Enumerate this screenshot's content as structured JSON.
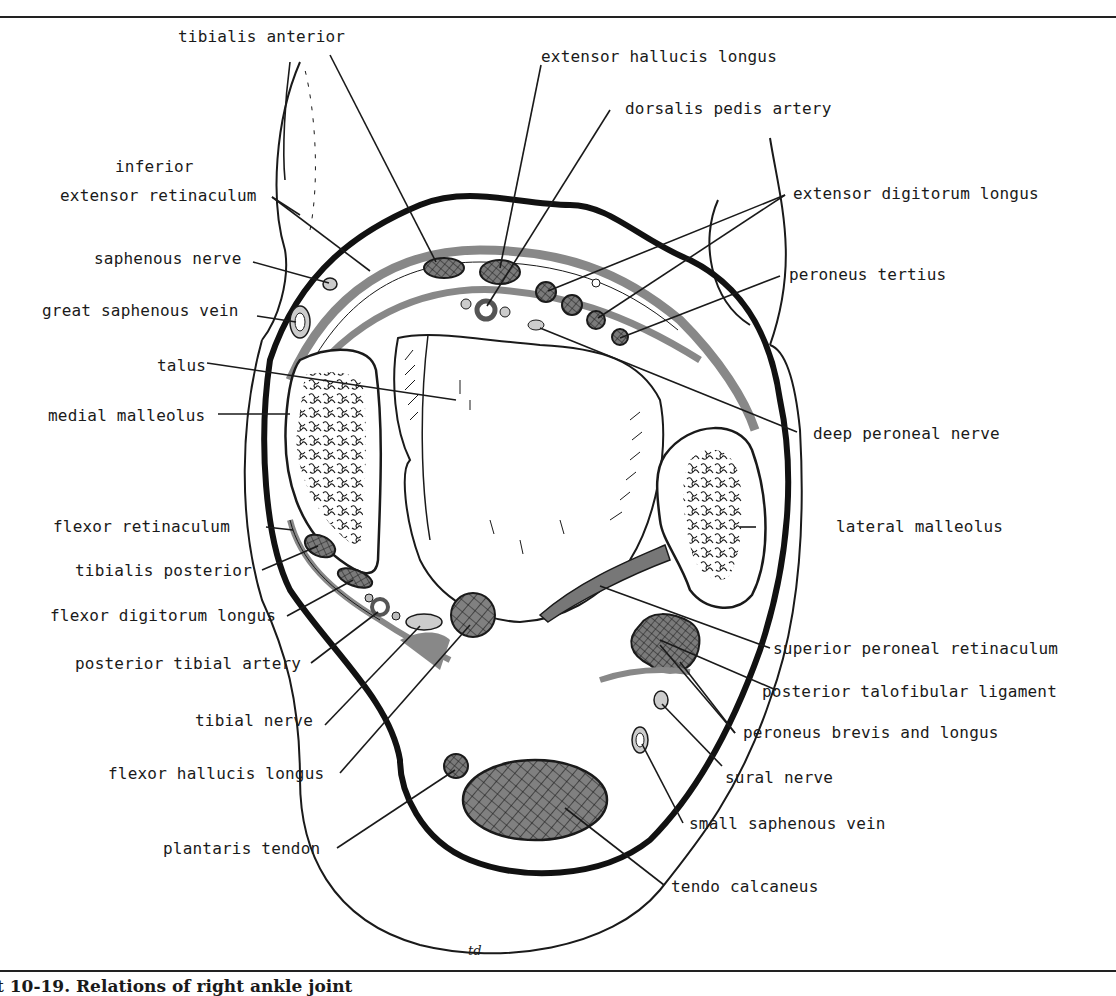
{
  "figure": {
    "caption": "t 10-19. Relations of right ankle joint",
    "artist_signature": "td",
    "accent_colors": {
      "ink": "#1a1a1a",
      "tendon_fill": "#7a7a7a",
      "retinaculum_fill": "#9a9a9a",
      "vessel_fill": "#c8c8c8"
    }
  },
  "labels": {
    "tibialis_anterior": "tibialis anterior",
    "extensor_hallucis_longus": "extensor hallucis longus",
    "dorsalis_pedis_artery": "dorsalis pedis artery",
    "inferior_extensor_retinaculum_l1": "inferior",
    "inferior_extensor_retinaculum_l2": "extensor retinaculum",
    "extensor_digitorum_longus": "extensor digitorum longus",
    "saphenous_nerve": "saphenous nerve",
    "great_saphenous_vein": "great saphenous vein",
    "peroneus_tertius": "peroneus tertius",
    "talus": "talus",
    "medial_malleolus": "medial malleolus",
    "deep_peroneal_nerve": "deep peroneal nerve",
    "flexor_retinaculum": "flexor retinaculum",
    "lateral_malleolus": "lateral malleolus",
    "tibialis_posterior": "tibialis posterior",
    "flexor_digitorum_longus": "flexor digitorum longus",
    "posterior_tibial_artery": "posterior tibial artery",
    "superior_peroneal_retinaculum": "superior peroneal retinaculum",
    "posterior_talofibular_ligament": "posterior talofibular ligament",
    "tibial_nerve": "tibial nerve",
    "peroneus_brevis_and_longus": "peroneus brevis and longus",
    "flexor_hallucis_longus": "flexor hallucis longus",
    "sural_nerve": "sural nerve",
    "small_saphenous_vein": "small saphenous vein",
    "plantaris_tendon": "plantaris tendon",
    "tendo_calcaneus": "tendo calcaneus"
  }
}
